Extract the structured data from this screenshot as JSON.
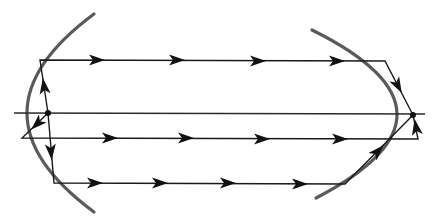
{
  "diagram": {
    "type": "two-paraboloid-mirror-ray-diagram",
    "colors": {
      "mirror": "#5a5a5a",
      "ray": "#1a1a1a",
      "arrow": "#111111",
      "background": "#ffffff"
    },
    "mirrors": [
      {
        "id": "left-mirror",
        "path": "M 94 14 Q -40 113 94 212"
      },
      {
        "id": "right-mirror",
        "path": "M 312 30 Q 480 113 316 198"
      }
    ],
    "foci": [
      {
        "id": "left-focus",
        "x": 48,
        "y": 113
      },
      {
        "id": "right-focus",
        "x": 413,
        "y": 115
      }
    ],
    "axis": {
      "x1": 14,
      "y1": 113,
      "x2": 425,
      "y2": 114
    },
    "rays": [
      {
        "id": "top-ray",
        "points": "48,113 40,60 385,61 413,115",
        "arrows": [
          {
            "x": 44,
            "y": 86,
            "angle": -98
          },
          {
            "x": 97,
            "y": 60,
            "angle": 0
          },
          {
            "x": 177,
            "y": 60,
            "angle": 0
          },
          {
            "x": 258,
            "y": 61,
            "angle": 0
          },
          {
            "x": 337,
            "y": 61,
            "angle": 0
          },
          {
            "x": 398,
            "y": 86,
            "angle": 62
          }
        ]
      },
      {
        "id": "middle-ray",
        "points": "48,113 22,138 418,139 413,115",
        "arrows": [
          {
            "x": 37,
            "y": 124,
            "angle": 136
          },
          {
            "x": 110,
            "y": 138,
            "angle": 0
          },
          {
            "x": 186,
            "y": 138,
            "angle": 0
          },
          {
            "x": 262,
            "y": 139,
            "angle": 0
          },
          {
            "x": 340,
            "y": 139,
            "angle": 0
          },
          {
            "x": 416,
            "y": 127,
            "angle": -100
          }
        ]
      },
      {
        "id": "bottom-ray",
        "points": "48,113 54,183 345,184 413,115",
        "arrows": [
          {
            "x": 51,
            "y": 152,
            "angle": 85
          },
          {
            "x": 95,
            "y": 183,
            "angle": 0
          },
          {
            "x": 160,
            "y": 183,
            "angle": 0
          },
          {
            "x": 228,
            "y": 183,
            "angle": 0
          },
          {
            "x": 300,
            "y": 184,
            "angle": 0
          },
          {
            "x": 378,
            "y": 151,
            "angle": -46
          }
        ]
      }
    ]
  }
}
